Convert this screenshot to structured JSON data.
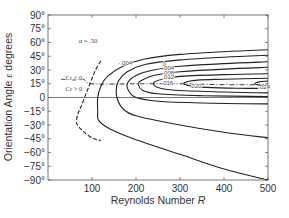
{
  "chart_data": {
    "type": "line",
    "title": "",
    "xlabel": "Reynolds Number R",
    "xlabel_main": "Reynolds Number ",
    "xlabel_italic": "R",
    "ylabel": "Orientation Angle ε degrees",
    "xlim": [
      0,
      500
    ],
    "ylim": [
      -90,
      90
    ],
    "grid": false,
    "legend": null,
    "x_ticks": [
      100,
      200,
      300,
      400,
      500
    ],
    "x_tick_labels": [
      "100",
      "200",
      "300",
      "400",
      "500"
    ],
    "y_ticks": [
      90,
      75,
      60,
      45,
      30,
      15,
      0,
      -15,
      -30,
      -45,
      -60,
      -75,
      -90
    ],
    "y_tick_labels": [
      "90°",
      "75°",
      "60°",
      "45°",
      "30°",
      "15°",
      "0",
      "−15°",
      "−30°",
      "−45°",
      "−60°",
      "−75°",
      "−90°"
    ],
    "annotations": [
      {
        "text": "α = .50",
        "x": 70,
        "y": 62
      },
      {
        "text": "Cr < 0",
        "x": 40,
        "y": 21
      },
      {
        "text": "Cr > 0",
        "x": 40,
        "y": 9
      },
      {
        "text": "-.004",
        "x": 160,
        "y": 38
      },
      {
        "text": "0",
        "x": 260,
        "y": 37
      },
      {
        "text": ".004",
        "x": 260,
        "y": 32
      },
      {
        "text": ".008",
        "x": 260,
        "y": 27
      },
      {
        "text": ".012",
        "x": 260,
        "y": 22
      },
      {
        "text": ".016",
        "x": 258,
        "y": 16
      },
      {
        "text": ".020",
        "x": 322,
        "y": 13
      },
      {
        "text": ".024",
        "x": 478,
        "y": 11
      }
    ],
    "series": [
      {
        "name": "-.004 (dashed, Cr=0 boundary)",
        "style": "dashed",
        "points": [
          [
            120,
            40
          ],
          [
            108,
            30
          ],
          [
            98,
            18
          ],
          [
            88,
            6
          ],
          [
            75,
            -10
          ],
          [
            68,
            -18
          ],
          [
            65,
            -28
          ],
          [
            78,
            -36
          ],
          [
            100,
            -44
          ],
          [
            120,
            -47
          ]
        ]
      },
      {
        "name": "Cr=0 / Cr>0 separator (dash-dot)",
        "style": "dash-dot",
        "points": [
          [
            30,
            20
          ],
          [
            55,
            19
          ],
          [
            80,
            20
          ],
          [
            100,
            15
          ],
          [
            200,
            15
          ],
          [
            300,
            15
          ],
          [
            400,
            14
          ],
          [
            500,
            14
          ]
        ]
      },
      {
        "name": "0",
        "style": "solid",
        "points": [
          [
            500,
            52
          ],
          [
            400,
            50
          ],
          [
            300,
            47
          ],
          [
            220,
            42
          ],
          [
            170,
            34
          ],
          [
            135,
            23
          ],
          [
            120,
            12
          ],
          [
            113,
            0
          ],
          [
            113,
            -15
          ],
          [
            115,
            -25
          ],
          [
            140,
            -34
          ],
          [
            200,
            -46
          ],
          [
            300,
            -62
          ],
          [
            400,
            -78
          ],
          [
            500,
            -90
          ]
        ]
      },
      {
        "name": ".004",
        "style": "solid",
        "points": [
          [
            500,
            46
          ],
          [
            400,
            44
          ],
          [
            300,
            41
          ],
          [
            220,
            36
          ],
          [
            180,
            28
          ],
          [
            160,
            18
          ],
          [
            155,
            8
          ],
          [
            158,
            -2
          ],
          [
            170,
            -12
          ],
          [
            200,
            -20
          ],
          [
            300,
            -30
          ],
          [
            400,
            -38
          ],
          [
            500,
            -44
          ]
        ]
      },
      {
        "name": ".008",
        "style": "solid",
        "points": [
          [
            500,
            39
          ],
          [
            400,
            37
          ],
          [
            300,
            34
          ],
          [
            240,
            30
          ],
          [
            200,
            24
          ],
          [
            180,
            15
          ],
          [
            185,
            6
          ],
          [
            200,
            0
          ],
          [
            250,
            -4
          ],
          [
            350,
            -6
          ],
          [
            500,
            -7
          ]
        ]
      },
      {
        "name": ".012",
        "style": "solid",
        "points": [
          [
            500,
            33
          ],
          [
            400,
            31
          ],
          [
            300,
            28
          ],
          [
            240,
            24
          ],
          [
            210,
            18
          ],
          [
            205,
            14
          ],
          [
            215,
            8
          ],
          [
            250,
            4
          ],
          [
            350,
            2
          ],
          [
            500,
            1
          ]
        ]
      },
      {
        "name": ".016",
        "style": "solid",
        "points": [
          [
            500,
            26
          ],
          [
            400,
            25
          ],
          [
            300,
            23
          ],
          [
            260,
            20
          ],
          [
            240,
            16
          ],
          [
            250,
            11
          ],
          [
            290,
            8
          ],
          [
            400,
            6
          ],
          [
            500,
            5
          ]
        ]
      },
      {
        "name": ".020",
        "style": "solid",
        "points": [
          [
            500,
            21
          ],
          [
            400,
            20
          ],
          [
            340,
            19
          ],
          [
            310,
            16
          ],
          [
            320,
            13
          ],
          [
            360,
            11
          ],
          [
            430,
            10
          ],
          [
            500,
            10
          ]
        ]
      },
      {
        "name": ".024",
        "style": "solid",
        "points": [
          [
            500,
            18
          ],
          [
            480,
            17
          ],
          [
            470,
            15
          ],
          [
            480,
            13.5
          ],
          [
            500,
            13
          ]
        ]
      }
    ]
  },
  "axes": {
    "y_title": "Orientation Angle ε degrees",
    "y_title_main": "Orientation Angle ",
    "y_title_eps": "ε",
    "y_title_unit": " degrees"
  }
}
